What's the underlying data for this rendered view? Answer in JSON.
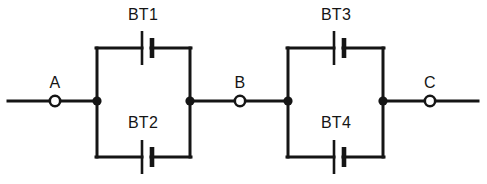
{
  "diagram": {
    "type": "electrical-schematic",
    "width": 487,
    "height": 184,
    "background_color": "#ffffff",
    "line_color": "#151515"
  },
  "components": [
    {
      "id": "BT1",
      "label": "BT1",
      "kind": "battery-cell",
      "branch": "left-loop-top",
      "label_x": 143,
      "label_y": 20,
      "symbol_x": 146,
      "symbol_y": 48,
      "label_position": "above-symbol-outside-loop"
    },
    {
      "id": "BT2",
      "label": "BT2",
      "kind": "battery-cell",
      "branch": "left-loop-bottom",
      "label_x": 143,
      "label_y": 128,
      "symbol_x": 146,
      "symbol_y": 157,
      "label_position": "above-symbol-inside-loop"
    },
    {
      "id": "BT3",
      "label": "BT3",
      "kind": "battery-cell",
      "branch": "right-loop-top",
      "label_x": 336,
      "label_y": 20,
      "symbol_x": 338,
      "symbol_y": 48,
      "label_position": "above-symbol-outside-loop"
    },
    {
      "id": "BT4",
      "label": "BT4",
      "kind": "battery-cell",
      "branch": "right-loop-bottom",
      "label_x": 336,
      "label_y": 128,
      "symbol_x": 338,
      "symbol_y": 157,
      "label_position": "above-symbol-inside-loop"
    }
  ],
  "terminals": [
    {
      "id": "A",
      "label": "A",
      "x": 55,
      "y": 101,
      "label_x": 55,
      "label_y": 88,
      "style": "open-circle"
    },
    {
      "id": "B",
      "label": "B",
      "x": 240,
      "y": 101,
      "label_x": 240,
      "label_y": 88,
      "style": "open-circle"
    },
    {
      "id": "C",
      "label": "C",
      "x": 430,
      "y": 101,
      "label_x": 430,
      "label_y": 88,
      "style": "open-circle"
    }
  ],
  "junctions": [
    {
      "id": "J1",
      "x": 97,
      "y": 101,
      "style": "filled-dot"
    },
    {
      "id": "J2",
      "x": 190,
      "y": 101,
      "style": "filled-dot"
    },
    {
      "id": "J3",
      "x": 288,
      "y": 101,
      "style": "filled-dot"
    },
    {
      "id": "J4",
      "x": 383,
      "y": 101,
      "style": "filled-dot"
    }
  ],
  "wires": {
    "main_rail_y": 101,
    "main_rail_start_x": 8,
    "main_rail_end_x": 478,
    "left_loop": {
      "left_x": 97,
      "right_x": 190,
      "top_y": 48,
      "bottom_y": 157
    },
    "right_loop": {
      "left_x": 288,
      "right_x": 383,
      "top_y": 48,
      "bottom_y": 157
    }
  },
  "battery_symbol": {
    "long_plate_height": 34,
    "short_plate_height": 20,
    "plate_gap": 8,
    "long_plate_offset": -4,
    "short_plate_offset": 4
  }
}
